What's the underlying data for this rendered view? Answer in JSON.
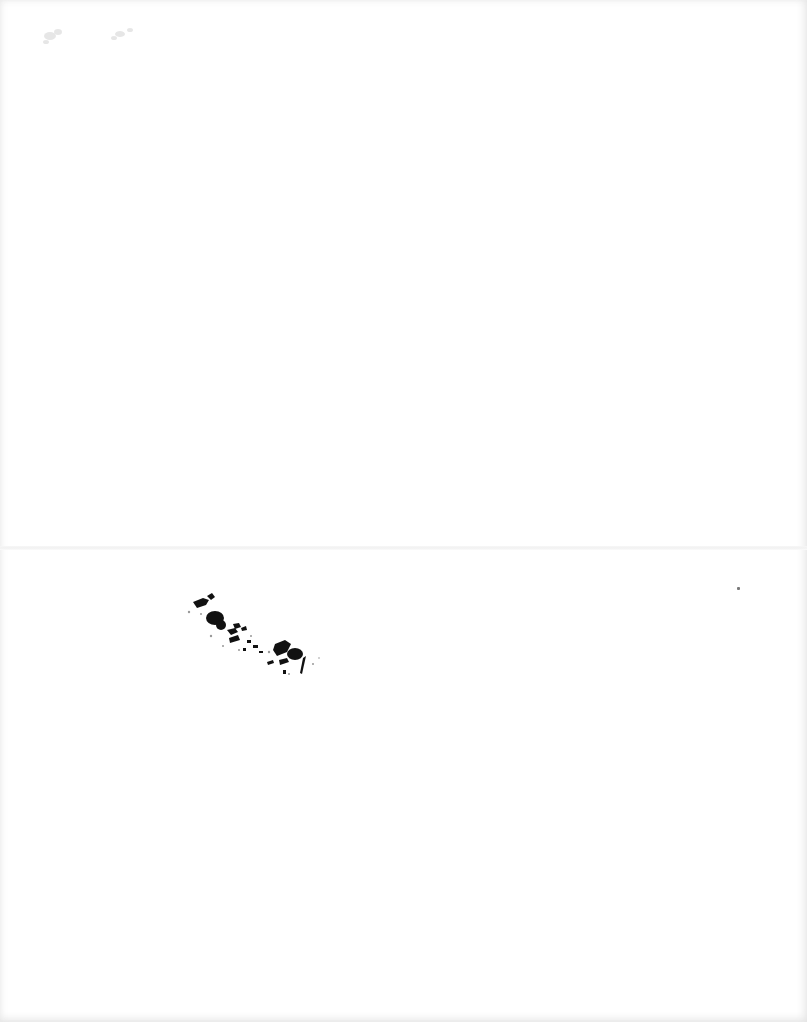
{
  "document": {
    "type": "scanned-page",
    "background_color": "#ffffff",
    "has_fold_line": true,
    "fold_line_color": "#f1f1f1",
    "marks": [
      {
        "name": "faint-smudge",
        "legible": false,
        "color": "#d8d8d8"
      },
      {
        "name": "ink-blot-handwriting",
        "legible": false,
        "color": "#111111"
      },
      {
        "name": "speck",
        "legible": false,
        "color": "#7a7a7a"
      }
    ]
  }
}
